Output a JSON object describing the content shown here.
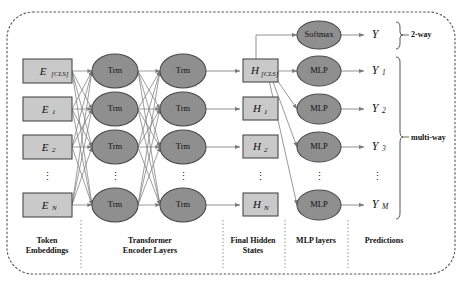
{
  "figure": {
    "colors": {
      "box_fill": "#c9c9c9",
      "box_stroke": "#4a4a4a",
      "ellipse_fill": "#8f8f8f",
      "ellipse_stroke": "#4a4a4a",
      "edge": "#6e6e6e",
      "border": "#555555",
      "text": "#111111"
    }
  },
  "columns": [
    {
      "caption": "Token\nEmbeddings",
      "caption_line1": "Token",
      "caption_line2": "Embeddings"
    },
    {
      "caption": "Transformer\nEncoder Layers",
      "caption_line1": "Transformer",
      "caption_line2": "Encoder Layers"
    },
    {
      "caption": "Final Hidden\nStates",
      "caption_line1": "Final Hidden",
      "caption_line2": "States"
    },
    {
      "caption": "MLP layers",
      "caption_line1": "MLP layers",
      "caption_line2": ""
    },
    {
      "caption": "Predictions",
      "caption_line1": "Predictions",
      "caption_line2": ""
    }
  ],
  "embeddings": [
    {
      "base": "E",
      "sub": "[CLS]",
      "y": 71
    },
    {
      "base": "E",
      "sub": "1",
      "y": 109
    },
    {
      "base": "E",
      "sub": "2",
      "y": 147
    },
    {
      "base": "E",
      "sub": "N",
      "y": 205
    }
  ],
  "embeddings_ellipsis": {
    "glyph": "⋮",
    "y": 177
  },
  "encoder_layer_1": [
    {
      "label": "Trm",
      "y": 71
    },
    {
      "label": "Trm",
      "y": 109
    },
    {
      "label": "Trm",
      "y": 147
    },
    {
      "label": "Trm",
      "y": 205
    }
  ],
  "encoder_layer_2": [
    {
      "label": "Trm",
      "y": 71
    },
    {
      "label": "Trm",
      "y": 109
    },
    {
      "label": "Trm",
      "y": 147
    },
    {
      "label": "Trm",
      "y": 205
    }
  ],
  "encoder_ellipsis": {
    "glyph": "⋮"
  },
  "hidden_states": [
    {
      "base": "H",
      "sub": "[CLS]",
      "y": 71
    },
    {
      "base": "H",
      "sub": "1",
      "y": 109
    },
    {
      "base": "H",
      "sub": "2",
      "y": 147
    },
    {
      "base": "H",
      "sub": "N",
      "y": 205
    }
  ],
  "hidden_ellipsis": {
    "glyph": "⋮",
    "y": 177
  },
  "heads": [
    {
      "label": "Softmax",
      "y": 35
    },
    {
      "label": "MLP",
      "y": 71
    },
    {
      "label": "MLP",
      "y": 109
    },
    {
      "label": "MLP",
      "y": 147
    },
    {
      "label": "MLP",
      "y": 205
    }
  ],
  "heads_ellipsis": {
    "glyph": "⋮",
    "y": 177
  },
  "predictions": [
    {
      "base": "Y",
      "sub": "",
      "y": 35
    },
    {
      "base": "Y",
      "sub": "1",
      "y": 71
    },
    {
      "base": "Y",
      "sub": "2",
      "y": 109
    },
    {
      "base": "Y",
      "sub": "3",
      "y": 147
    },
    {
      "base": "Y",
      "sub": "M",
      "y": 205
    }
  ],
  "predictions_ellipsis": {
    "glyph": "⋮",
    "y": 177
  },
  "braces": [
    {
      "label": "2-way",
      "top": 22,
      "bottom": 50,
      "label_y": 36
    },
    {
      "label": "multi-way",
      "top": 57,
      "bottom": 219,
      "label_y": 138
    }
  ]
}
